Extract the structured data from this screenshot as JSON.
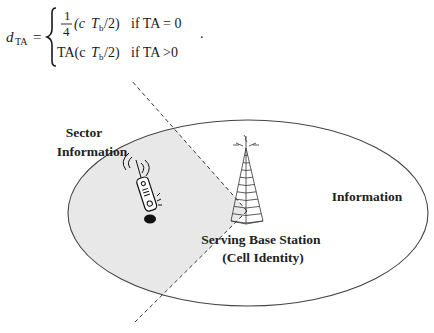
{
  "formula": {
    "lhs_symbol": "d",
    "lhs_subscript": "TA",
    "equals": "=",
    "case1": {
      "frac_num": "1",
      "frac_den": "4",
      "expr_open": "(c",
      "T": "T",
      "T_sub": "b",
      "expr_close": "/2)",
      "condition": "if TA = 0"
    },
    "case2": {
      "prefix": "TA(c",
      "T": "T",
      "T_sub": "b",
      "expr_close": "/2)",
      "condition": "if TA >0"
    },
    "terminator": "."
  },
  "diagram": {
    "labels": {
      "sector_line1": "Sector",
      "sector_line2": "Information",
      "cell_info": "Information",
      "base_station_line1": "Serving Base Station",
      "base_station_line2": "(Cell Identity)"
    },
    "colors": {
      "sector_fill": "#e8e8e8",
      "outline": "#333333",
      "dashed": "#333333"
    }
  }
}
